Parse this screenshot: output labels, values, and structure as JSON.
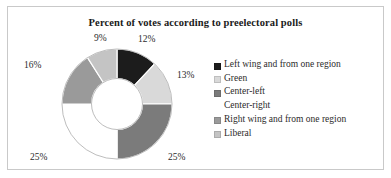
{
  "chart_data": {
    "type": "pie",
    "variant": "doughnut",
    "title": "Percent of votes according to preelectoral polls",
    "xlabel": "",
    "ylabel": "",
    "units": "percent",
    "grid": false,
    "legend_position": "right",
    "start_angle_deg": 0,
    "direction": "clockwise",
    "categories": [
      "Left wing and from one region",
      "Green",
      "Center-left",
      "Center-right",
      "Right wing and from one region",
      "Liberal"
    ],
    "values": [
      12,
      13,
      25,
      25,
      16,
      9
    ],
    "data_labels": [
      "12%",
      "13%",
      "25%",
      "25%",
      "16%",
      "9%"
    ],
    "colors": [
      "#1c1c1c",
      "#d9d9d9",
      "#7b7b7b",
      "#ffffff",
      "#9a9a9a",
      "#c4c4c4"
    ],
    "total": 100
  },
  "title": {
    "text": "Percent of votes according to preelectoral polls"
  },
  "slices": [
    {
      "label": "12%",
      "category": "Left wing and from one region",
      "value": 12,
      "color": "#1c1c1c"
    },
    {
      "label": "13%",
      "category": "Green",
      "value": 13,
      "color": "#d9d9d9"
    },
    {
      "label": "25%",
      "category": "Center-left",
      "value": 25,
      "color": "#7b7b7b"
    },
    {
      "label": "25%",
      "category": "Center-right",
      "value": 25,
      "color": "#ffffff"
    },
    {
      "label": "16%",
      "category": "Right wing and from one region",
      "value": 16,
      "color": "#9a9a9a"
    },
    {
      "label": "9%",
      "category": "Liberal",
      "value": 9,
      "color": "#c4c4c4"
    }
  ],
  "legend": {
    "items": [
      {
        "label": "Left wing and from one region",
        "color": "#1c1c1c"
      },
      {
        "label": "Green",
        "color": "#d9d9d9"
      },
      {
        "label": "Center-left",
        "color": "#7b7b7b"
      },
      {
        "label": "Center-right",
        "color": "#ffffff"
      },
      {
        "label": "Right wing and from one region",
        "color": "#9a9a9a"
      },
      {
        "label": "Liberal",
        "color": "#c4c4c4"
      }
    ]
  }
}
